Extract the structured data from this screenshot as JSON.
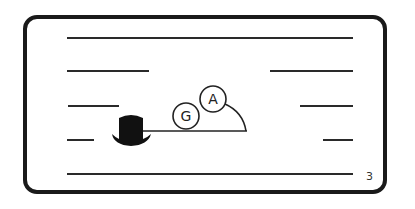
{
  "illustration": {
    "description": "Card with horizontal rule lines, a black top hat connected by a line to two lettered circles under an arc",
    "circles": [
      {
        "label": "G"
      },
      {
        "label": "A"
      }
    ],
    "page_number": "3",
    "colors": {
      "ink": "#1a1a1a",
      "background": "#ffffff"
    }
  }
}
